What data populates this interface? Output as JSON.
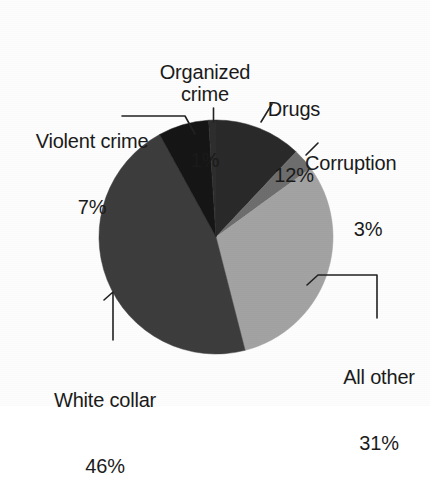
{
  "chart_data": {
    "type": "pie",
    "title": "",
    "subtitle": "",
    "xlabel": "",
    "ylabel": "",
    "legend_position": "none",
    "grid": false,
    "units": "percent",
    "total": 100,
    "start_angle_deg": 0,
    "direction": "clockwise",
    "categories": [
      "Drugs",
      "Corruption",
      "All other",
      "White collar",
      "Violent crime",
      "Organized crime"
    ],
    "values": [
      12,
      3,
      31,
      46,
      7,
      1
    ],
    "labels": [
      "Drugs 12%",
      "Corruption 3%",
      "All other 31%",
      "White collar 46%",
      "Violent crime 7%",
      "Organized crime 1%"
    ],
    "slices": [
      {
        "name": "Drugs",
        "value": 12,
        "percent_text": "12%",
        "color": "#2a2a2a",
        "start_deg": 0,
        "end_deg": 43.2
      },
      {
        "name": "Corruption",
        "value": 3,
        "percent_text": "3%",
        "color": "#6e6e6e",
        "start_deg": 43.2,
        "end_deg": 54.0
      },
      {
        "name": "All other",
        "value": 31,
        "percent_text": "31%",
        "color": "#a3a3a3",
        "start_deg": 54.0,
        "end_deg": 165.6
      },
      {
        "name": "White collar",
        "value": 46,
        "percent_text": "46%",
        "color": "#3d3d3d",
        "start_deg": 165.6,
        "end_deg": 331.2
      },
      {
        "name": "Violent crime",
        "value": 7,
        "percent_text": "7%",
        "color": "#181818",
        "start_deg": 331.2,
        "end_deg": 356.4
      },
      {
        "name": "Organized crime",
        "value": 1,
        "percent_text": "1%",
        "color": "#2e2e2e",
        "start_deg": 356.4,
        "end_deg": 360.0
      }
    ]
  },
  "labels": {
    "organized_crime": {
      "name": "Organized\ncrime",
      "percent": "1%"
    },
    "drugs": {
      "name": "Drugs",
      "percent": "12%"
    },
    "corruption": {
      "name": "Corruption",
      "percent": "3%"
    },
    "violent_crime": {
      "name": "Violent crime",
      "percent": "7%"
    },
    "white_collar": {
      "name": "White collar",
      "percent": "46%"
    },
    "all_other": {
      "name": "All other",
      "percent": "31%"
    }
  },
  "colors": {
    "background": "#fdfdfd",
    "text": "#1b1b1b",
    "leader_line": "#222222",
    "drugs": "#2a2a2a",
    "corruption": "#6e6e6e",
    "all_other": "#a3a3a3",
    "white_collar": "#3d3d3d",
    "violent_crime": "#181818",
    "organized_crime": "#2e2e2e"
  },
  "geometry": {
    "center_x": 216,
    "center_y": 237,
    "radius": 117
  }
}
